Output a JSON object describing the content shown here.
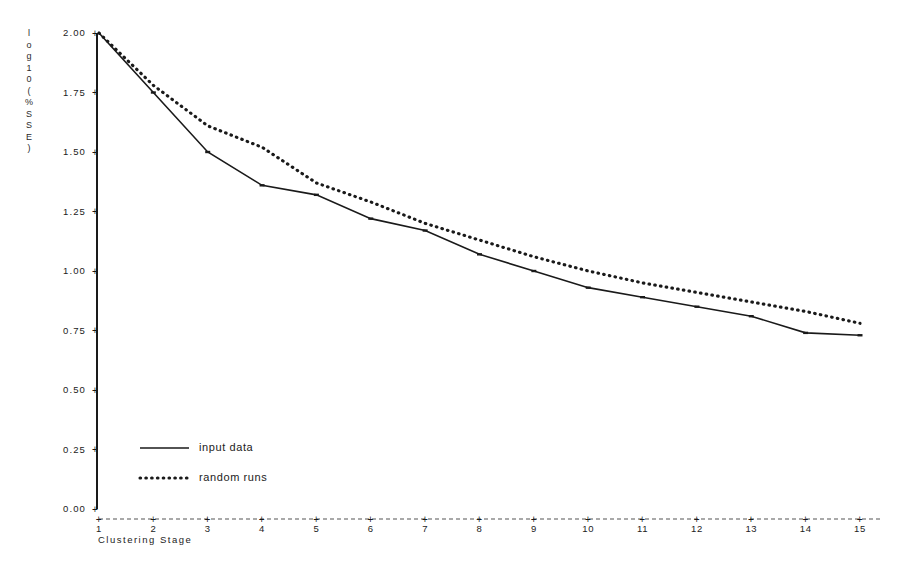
{
  "chart_data": {
    "type": "line",
    "title": "",
    "xlabel": "Clustering Stage",
    "ylabel": "log10(%SSE)",
    "ylabel_chars": [
      "l",
      "o",
      "g",
      "1",
      "0",
      "(",
      "%",
      "S",
      "S",
      "E",
      ")"
    ],
    "x": [
      1,
      2,
      3,
      4,
      5,
      6,
      7,
      8,
      9,
      10,
      11,
      12,
      13,
      14,
      15
    ],
    "xlim": [
      1,
      15
    ],
    "ylim": [
      0.0,
      2.0
    ],
    "xticks": [
      "1",
      "2",
      "3",
      "4",
      "5",
      "6",
      "7",
      "8",
      "9",
      "10",
      "11",
      "12",
      "13",
      "14",
      "15"
    ],
    "yticks": [
      "0.00",
      "0.25",
      "0.50",
      "0.75",
      "1.00",
      "1.25",
      "1.50",
      "1.75",
      "2.00"
    ],
    "ytick_values": [
      0.0,
      0.25,
      0.5,
      0.75,
      1.0,
      1.25,
      1.5,
      1.75,
      2.0
    ],
    "grid": false,
    "legend_position": "lower-left",
    "series": [
      {
        "name": "input data",
        "style": "solid",
        "color": "#1a1a1a",
        "values": [
          2.0,
          1.75,
          1.5,
          1.36,
          1.32,
          1.22,
          1.17,
          1.07,
          1.0,
          0.93,
          0.89,
          0.85,
          0.81,
          0.74,
          0.73
        ]
      },
      {
        "name": "random runs",
        "style": "dotted",
        "color": "#1a1a1a",
        "values": [
          2.0,
          1.78,
          1.61,
          1.52,
          1.37,
          1.29,
          1.2,
          1.13,
          1.06,
          1.0,
          0.95,
          0.91,
          0.87,
          0.83,
          0.78
        ]
      }
    ]
  },
  "axis": {
    "y_axis_name": "y-axis",
    "x_axis_name": "x-axis",
    "tick_marker": "+"
  },
  "legend": {
    "items": [
      {
        "label": "input data",
        "style": "solid"
      },
      {
        "label": "random runs",
        "style": "dotted"
      }
    ]
  }
}
